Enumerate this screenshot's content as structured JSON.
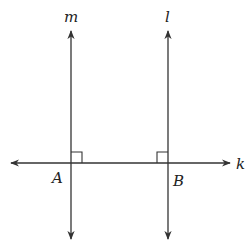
{
  "diagram": {
    "colors": {
      "stroke": "#333333",
      "text": "#222222",
      "background": "#ffffff"
    },
    "lines": [
      {
        "name": "m",
        "label": "m",
        "orientation": "vertical",
        "x": 71,
        "arrows": "both"
      },
      {
        "name": "l",
        "label": "l",
        "orientation": "vertical",
        "x": 168,
        "arrows": "both"
      },
      {
        "name": "k",
        "label": "k",
        "orientation": "horizontal",
        "y": 163,
        "arrows": "both"
      }
    ],
    "points": [
      {
        "label": "A",
        "on": [
          "m",
          "k"
        ]
      },
      {
        "label": "B",
        "on": [
          "l",
          "k"
        ]
      }
    ],
    "right_angle_marks": [
      {
        "at": "A",
        "between": [
          "m",
          "k"
        ]
      },
      {
        "at": "B",
        "between": [
          "l",
          "k"
        ]
      }
    ],
    "labels": {
      "m": "m",
      "l": "l",
      "k": "k",
      "A": "A",
      "B": "B"
    }
  }
}
